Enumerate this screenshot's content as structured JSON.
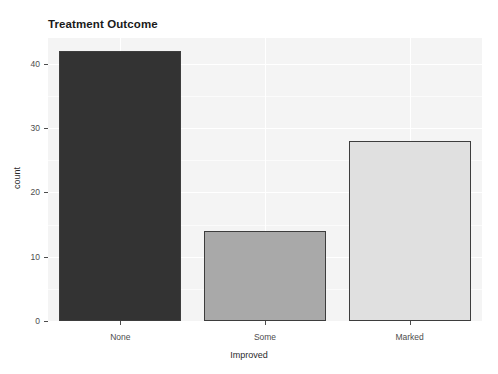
{
  "chart_data": {
    "type": "bar",
    "title": "Treatment Outcome",
    "xlabel": "Improved",
    "ylabel": "count",
    "categories": [
      "None",
      "Some",
      "Marked"
    ],
    "values": [
      42,
      14,
      28
    ],
    "bar_colors": [
      "#333333",
      "#a9a9a9",
      "#e0e0e0"
    ],
    "bar_outline_color": "#3d3d3d",
    "ylim": [
      0,
      44
    ],
    "yticks": [
      0,
      10,
      20,
      30,
      40
    ],
    "ytick_labels": [
      "0",
      "10",
      "20",
      "30",
      "40"
    ],
    "xticks": [
      "None",
      "Some",
      "Marked"
    ],
    "grid": true,
    "grid_color": "#ffffff",
    "panel_background": "#f4f4f4",
    "legend": null,
    "legend_position": "none"
  },
  "axis": {
    "y_title": "count",
    "x_title": "Improved"
  },
  "title": {
    "text": "Treatment Outcome"
  }
}
